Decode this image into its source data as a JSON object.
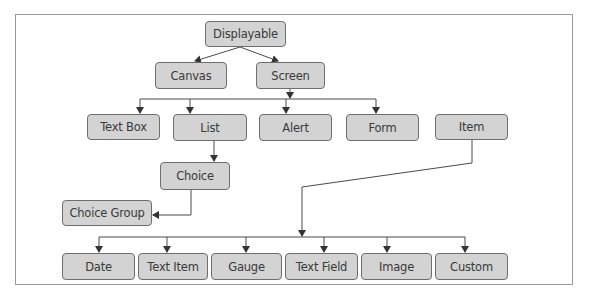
{
  "diagram": {
    "colors": {
      "node_fill": "#d3d3d3",
      "node_border": "#6e6e6e",
      "line": "#4a4a4a",
      "text": "#3a3a3a"
    },
    "nodes": {
      "displayable": "Displayable",
      "canvas": "Canvas",
      "screen": "Screen",
      "text_box": "Text Box",
      "list": "List",
      "alert": "Alert",
      "form": "Form",
      "item": "Item",
      "choice": "Choice",
      "choice_group": "Choice Group",
      "date": "Date",
      "text_item": "Text Item",
      "gauge": "Gauge",
      "text_field": "Text Field",
      "image": "Image",
      "custom": "Custom"
    },
    "edges": [
      [
        "Displayable",
        "Canvas"
      ],
      [
        "Displayable",
        "Screen"
      ],
      [
        "Screen",
        "Text Box"
      ],
      [
        "Screen",
        "List"
      ],
      [
        "Screen",
        "Alert"
      ],
      [
        "Screen",
        "Form"
      ],
      [
        "List",
        "Choice"
      ],
      [
        "Choice",
        "Choice Group"
      ],
      [
        "Item",
        "Date"
      ],
      [
        "Item",
        "Text Item"
      ],
      [
        "Item",
        "Gauge"
      ],
      [
        "Item",
        "Text Field"
      ],
      [
        "Item",
        "Image"
      ],
      [
        "Item",
        "Custom"
      ]
    ]
  }
}
